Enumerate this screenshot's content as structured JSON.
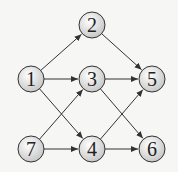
{
  "diagram": {
    "type": "directed-graph",
    "nodes": [
      {
        "id": "1",
        "label": "1",
        "x": 31,
        "y": 79
      },
      {
        "id": "2",
        "label": "2",
        "x": 92,
        "y": 25
      },
      {
        "id": "3",
        "label": "3",
        "x": 92,
        "y": 79
      },
      {
        "id": "4",
        "label": "4",
        "x": 92,
        "y": 149
      },
      {
        "id": "5",
        "label": "5",
        "x": 152,
        "y": 79
      },
      {
        "id": "6",
        "label": "6",
        "x": 152,
        "y": 149
      },
      {
        "id": "7",
        "label": "7",
        "x": 31,
        "y": 149
      }
    ],
    "edges": [
      {
        "from": "1",
        "to": "2"
      },
      {
        "from": "1",
        "to": "3"
      },
      {
        "from": "1",
        "to": "4"
      },
      {
        "from": "2",
        "to": "5"
      },
      {
        "from": "3",
        "to": "5"
      },
      {
        "from": "3",
        "to": "6"
      },
      {
        "from": "7",
        "to": "3"
      },
      {
        "from": "7",
        "to": "4"
      },
      {
        "from": "4",
        "to": "5"
      },
      {
        "from": "4",
        "to": "6"
      }
    ],
    "node_radius": 13,
    "colors": {
      "edge": "#333333",
      "node_fill_center": "#ffffff",
      "node_fill_edge": "#c8c8c8",
      "node_stroke": "#333333"
    }
  }
}
